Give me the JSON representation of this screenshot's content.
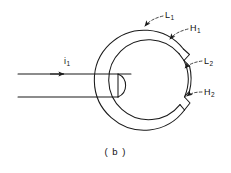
{
  "figure": {
    "caption": "( b )",
    "background_color": "#ffffff",
    "line_color": "#1a1a1a",
    "type": "line-drawing"
  },
  "labels": {
    "current": {
      "text": "i",
      "subscript": "1",
      "x": 64,
      "y": 57
    },
    "l1": {
      "text": "L",
      "subscript": "1",
      "x": 165,
      "y": 11
    },
    "h1": {
      "text": "H",
      "subscript": "1",
      "x": 190,
      "y": 24
    },
    "l2": {
      "text": "L",
      "subscript": "2",
      "x": 204,
      "y": 57
    },
    "h2": {
      "text": "H",
      "subscript": "2",
      "x": 204,
      "y": 88
    }
  },
  "geometry": {
    "ring_center_x": 148,
    "ring_center_y": 78,
    "outer_radius": 50,
    "inner_radius": 40,
    "feed_line_top_y": 74,
    "feed_line_bottom_y": 97,
    "feed_line_start_x": 18,
    "feed_arrow_x": 62,
    "loop_radius": 12
  }
}
